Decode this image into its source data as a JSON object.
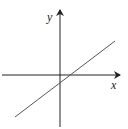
{
  "diagram": {
    "type": "coordinate-plane-line",
    "axes": {
      "x_label": "x",
      "y_label": "y"
    },
    "line": {
      "description": "straight line with positive slope, positive x-intercept, negative y-intercept"
    },
    "colors": {
      "axis": "#222222",
      "line": "#555555",
      "background": "#ffffff"
    }
  }
}
